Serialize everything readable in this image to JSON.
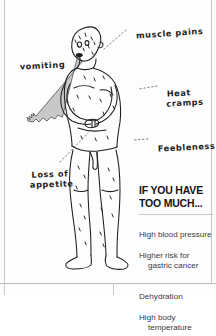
{
  "page": {
    "type": "illustrated-infographic-page",
    "background_color": "#fdfdfd",
    "frame_color": "#c9c9c9"
  },
  "illustration": {
    "subject": "standing human figure showing symptoms of excess salt intake",
    "style": "hand-drawn black ink line art",
    "line_color": "#1d1d1d",
    "vomit_color": "#c8c8c8",
    "details": [
      "bald head with sweat droplet marks",
      "gray vomit stream from mouth to left",
      "both arms clutching the stomach",
      "sweat marks across torso, arms and legs",
      "bare legs and feet"
    ]
  },
  "labels": [
    {
      "id": "muscle-pains",
      "text": "muscle pains",
      "lines": [
        "muscle pains"
      ]
    },
    {
      "id": "vomiting",
      "text": "vomiting",
      "lines": [
        "vomiting"
      ]
    },
    {
      "id": "heat-cramps",
      "text": "Heat cramps",
      "lines": [
        "Heat",
        "cramps"
      ]
    },
    {
      "id": "feebleness",
      "text": "Feebleness",
      "lines": [
        "Feebleness"
      ]
    },
    {
      "id": "loss-of-appetite",
      "text": "Loss of appetite",
      "lines": [
        "Loss of",
        "appetite"
      ]
    }
  ],
  "info_box": {
    "heading": "IF YOU HAVE\nTOO MUCH...",
    "items": [
      {
        "line1": "High blood pressure",
        "line2": ""
      },
      {
        "line1": "Higher risk for",
        "line2": "gastric cancer"
      },
      {
        "line1": "Dehydration",
        "line2": ""
      },
      {
        "line1": "High body",
        "line2": "temperature"
      }
    ]
  }
}
